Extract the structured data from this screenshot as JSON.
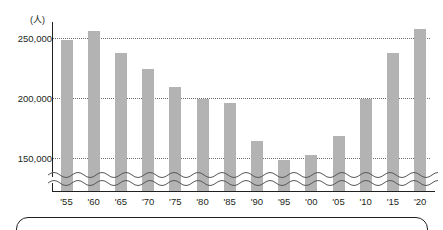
{
  "chart_data": {
    "type": "bar",
    "title": "",
    "subtitle": "",
    "xlabel": "",
    "ylabel": "",
    "unit_label": "(人)",
    "categories": [
      "'55",
      "'60",
      "'65",
      "'70",
      "'75",
      "'80",
      "'85",
      "'90",
      "'95",
      "'00",
      "'05",
      "'10",
      "'15",
      "'20"
    ],
    "values": [
      249000,
      256000,
      238000,
      225000,
      210000,
      200000,
      196000,
      165000,
      149000,
      153000,
      169000,
      200000,
      238000,
      258000
    ],
    "series": [
      {
        "name": "",
        "values": [
          249000,
          256000,
          238000,
          225000,
          210000,
          200000,
          196000,
          165000,
          149000,
          153000,
          169000,
          200000,
          238000,
          258000
        ]
      }
    ],
    "ytick_labels": [
      "250,000",
      "200,000",
      "150,000"
    ],
    "ytick_values": [
      250000,
      200000,
      150000
    ],
    "ylim": [
      130000,
      265000
    ],
    "axis_break": true,
    "grid": "horizontal-dotted",
    "legend": "none",
    "bar_color": "#b3b3b3",
    "axis_color": "#231f20",
    "grid_color": "#6d6e71"
  },
  "axis": {
    "unit": "(人)"
  },
  "ytick_labels": [
    {
      "text": "250,000"
    },
    {
      "text": "200,000"
    },
    {
      "text": "150,000"
    }
  ],
  "xtick_labels": [
    {
      "text": "'55"
    },
    {
      "text": "'60"
    },
    {
      "text": "'65"
    },
    {
      "text": "'70"
    },
    {
      "text": "'75"
    },
    {
      "text": "'80"
    },
    {
      "text": "'85"
    },
    {
      "text": "'90"
    },
    {
      "text": "'95"
    },
    {
      "text": "'00"
    },
    {
      "text": "'05"
    },
    {
      "text": "'10"
    },
    {
      "text": "'15"
    },
    {
      "text": "'20"
    }
  ]
}
